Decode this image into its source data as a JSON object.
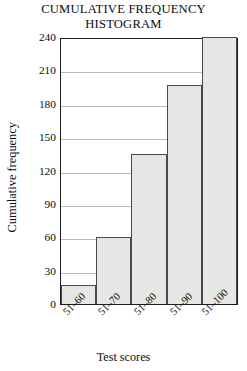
{
  "chart_data": {
    "type": "bar",
    "title": "CUMULATIVE FREQUENCY HISTOGRAM",
    "title_lines": [
      "CUMULATIVE FREQUENCY",
      "HISTOGRAM"
    ],
    "xlabel": "Test scores",
    "ylabel": "Cumulative frequency",
    "categories": [
      "51–60",
      "51–70",
      "51–80",
      "51–90",
      "51–100"
    ],
    "values": [
      17,
      60,
      135,
      197,
      240
    ],
    "ylim": [
      0,
      240
    ],
    "ytick_values": [
      0,
      30,
      60,
      90,
      120,
      150,
      180,
      210,
      240
    ],
    "ytick_labels": [
      "0",
      "30",
      "60",
      "90",
      "120",
      "150",
      "180",
      "210",
      "240"
    ],
    "grid": "horizontal",
    "legend": "none",
    "bar_fill_color": "#e6e6e4",
    "bar_border_color": "#4a4a4a",
    "axis_color": "#1d1d1d",
    "gridline_color": "#b9b9b9",
    "background_color": "#ffffff",
    "text_color": "#0d0d0d"
  }
}
